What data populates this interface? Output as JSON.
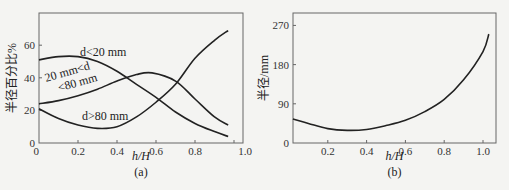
{
  "chart_data": [
    {
      "type": "line",
      "panel_label": "(a)",
      "xlabel": "h/H",
      "ylabel": "半径百分比%",
      "xlim": [
        0,
        1.0
      ],
      "ylim": [
        0,
        72
      ],
      "xticks": [
        0,
        0.2,
        0.4,
        0.6,
        0.8,
        1.0
      ],
      "xtick_labels": [
        "0",
        "0.2",
        "0.4",
        "0.6",
        "0.8",
        "1.0"
      ],
      "yticks": [
        0,
        20,
        40,
        60
      ],
      "ytick_labels": [
        "0",
        "20",
        "40",
        "60"
      ],
      "grid": false,
      "series": [
        {
          "name": "d<20 mm",
          "label_lines": [
            "d<20 mm"
          ],
          "x": [
            0,
            0.1,
            0.2,
            0.3,
            0.4,
            0.5,
            0.6,
            0.7,
            0.8,
            0.9,
            0.97
          ],
          "y": [
            51,
            53,
            53,
            50,
            44,
            36,
            28,
            19,
            12,
            7,
            4
          ]
        },
        {
          "name": "20 mm<d<80 mm",
          "label_lines": [
            "20 mm<d",
            "<80 mm"
          ],
          "x": [
            0,
            0.1,
            0.2,
            0.3,
            0.4,
            0.5,
            0.58,
            0.7,
            0.8,
            0.9,
            0.97
          ],
          "y": [
            24,
            26,
            29,
            33,
            38,
            42,
            43,
            38,
            27,
            16,
            11
          ]
        },
        {
          "name": "d>80 mm",
          "label_lines": [
            "d>80 mm"
          ],
          "x": [
            0,
            0.1,
            0.2,
            0.3,
            0.4,
            0.5,
            0.6,
            0.7,
            0.8,
            0.9,
            0.97
          ],
          "y": [
            21,
            15,
            11,
            9,
            10,
            16,
            25,
            36,
            52,
            63,
            69
          ]
        }
      ]
    },
    {
      "type": "line",
      "panel_label": "(b)",
      "xlabel": "h/H",
      "ylabel": "半径/mm",
      "xlim": [
        0.02,
        1.07
      ],
      "ylim": [
        0,
        290
      ],
      "xticks": [
        0.2,
        0.4,
        0.6,
        0.8,
        1.0
      ],
      "xtick_labels": [
        "0.2",
        "0.4",
        "0.6",
        "0.8",
        "1.0"
      ],
      "yticks": [
        0,
        90,
        180,
        270
      ],
      "ytick_labels": [
        "0",
        "90",
        "180",
        "270"
      ],
      "grid": false,
      "series": [
        {
          "name": "半径",
          "x": [
            0.02,
            0.1,
            0.2,
            0.3,
            0.4,
            0.5,
            0.6,
            0.7,
            0.8,
            0.9,
            1.0,
            1.03
          ],
          "y": [
            55,
            45,
            33,
            29,
            31,
            40,
            52,
            72,
            100,
            145,
            210,
            250
          ]
        }
      ]
    }
  ]
}
